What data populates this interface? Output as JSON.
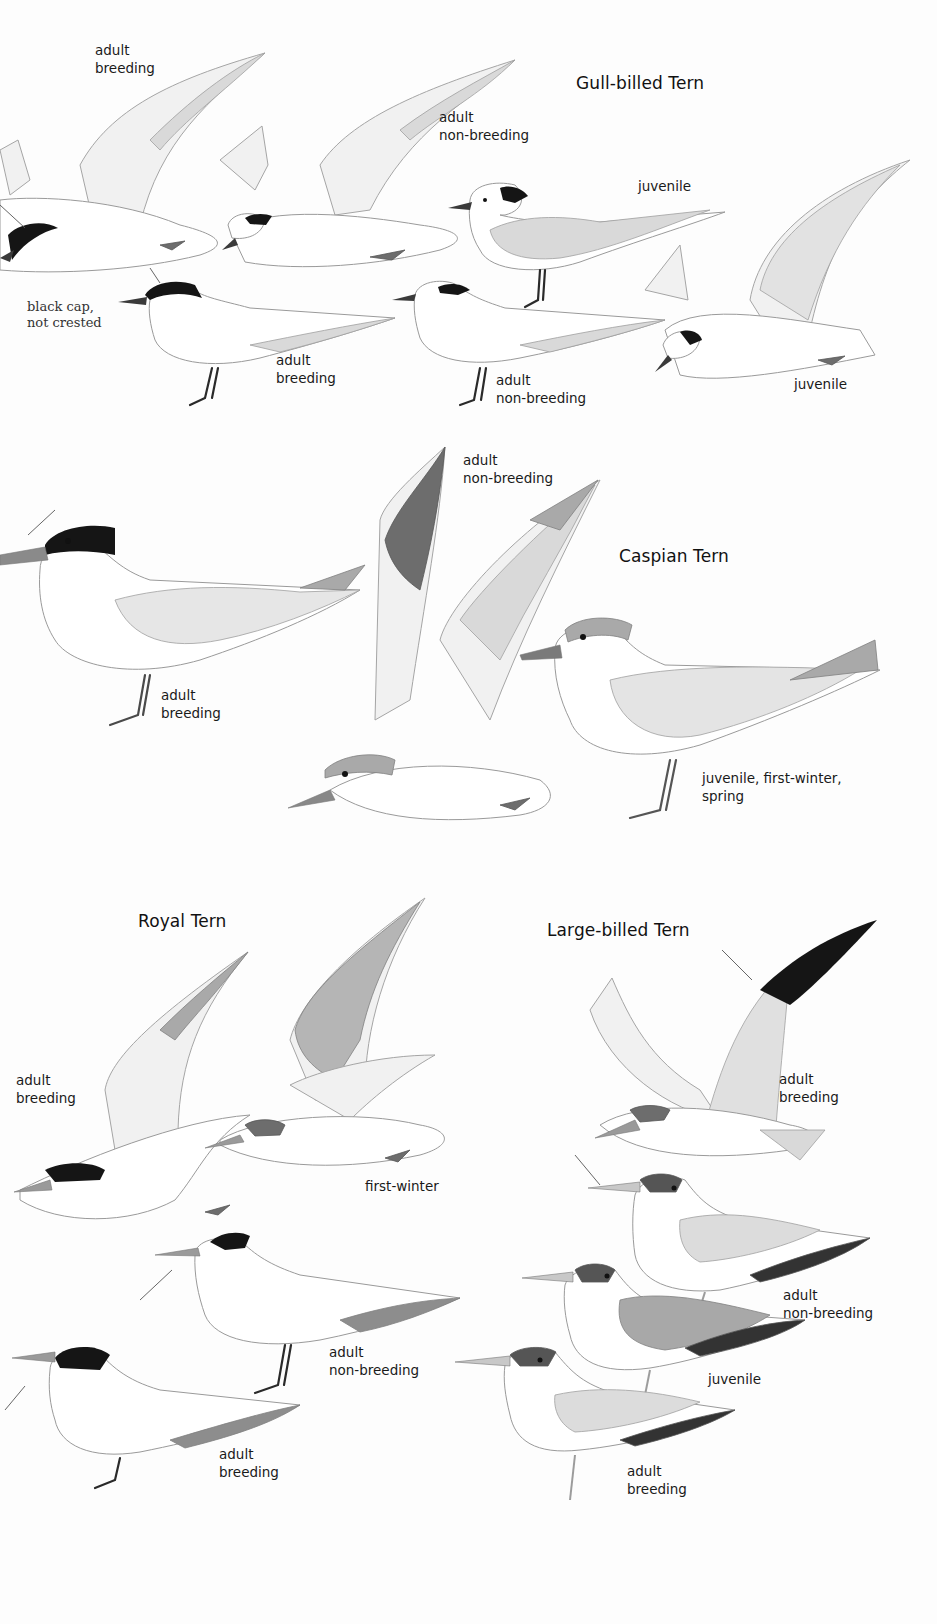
{
  "plate": {
    "sections": [
      {
        "species": "Gull-billed Tern",
        "labels": [
          {
            "id": "gb-fly-breeding",
            "text": "adult\nbreeding"
          },
          {
            "id": "gb-fly-nonbreeding",
            "text": "adult\nnon-breeding"
          },
          {
            "id": "gb-stand-juvenile",
            "text": "juvenile"
          },
          {
            "id": "gb-stand-breeding",
            "text": "adult\nbreeding"
          },
          {
            "id": "gb-stand-nonbreeding",
            "text": "adult\nnon-breeding"
          },
          {
            "id": "gb-fly-juvenile",
            "text": "juvenile"
          }
        ],
        "note": "black cap,\nnot crested"
      },
      {
        "species": "Caspian Tern",
        "labels": [
          {
            "id": "ca-fly-nonbreeding",
            "text": "adult\nnon-breeding"
          },
          {
            "id": "ca-stand-breeding",
            "text": "adult\nbreeding"
          },
          {
            "id": "ca-stand-juvenile",
            "text": "juvenile, first-winter,\nspring"
          }
        ]
      },
      {
        "species": "Royal Tern",
        "labels": [
          {
            "id": "ro-fly-breeding",
            "text": "adult\nbreeding"
          },
          {
            "id": "ro-fly-firstwinter",
            "text": "first-winter"
          },
          {
            "id": "ro-stand-nonbreeding",
            "text": "adult\nnon-breeding"
          },
          {
            "id": "ro-stand-breeding",
            "text": "adult\nbreeding"
          }
        ]
      },
      {
        "species": "Large-billed Tern",
        "labels": [
          {
            "id": "lb-fly-breeding",
            "text": "adult\nbreeding"
          },
          {
            "id": "lb-stand-nonbreeding",
            "text": "adult\nnon-breeding"
          },
          {
            "id": "lb-stand-juvenile",
            "text": "juvenile"
          },
          {
            "id": "lb-stand-breeding",
            "text": "adult\nbreeding"
          }
        ]
      }
    ]
  }
}
